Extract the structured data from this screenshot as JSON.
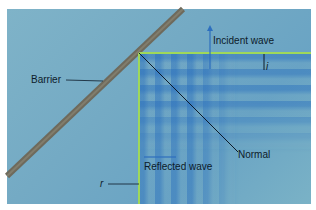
{
  "diagram": {
    "labels": {
      "barrier": "Barrier",
      "incident_wave": "Incident wave",
      "angle_i": "i",
      "normal": "Normal",
      "reflected_wave": "Reflected wave",
      "angle_r": "r"
    },
    "colors": {
      "water": "#74aac4",
      "wavefront": "#2d6fbe",
      "guide_line": "#9fd85a",
      "barrier": "#6e6a5c",
      "label_text": "#0d1b2a"
    }
  }
}
